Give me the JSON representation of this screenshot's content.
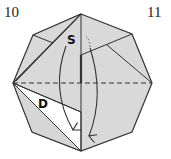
{
  "steps": {
    "left": "10",
    "right": "11"
  },
  "labels": {
    "s": "S",
    "d": "D"
  },
  "colors": {
    "paper": "#d9d9d9",
    "white_region": "#ffffff",
    "line": "#333333"
  }
}
